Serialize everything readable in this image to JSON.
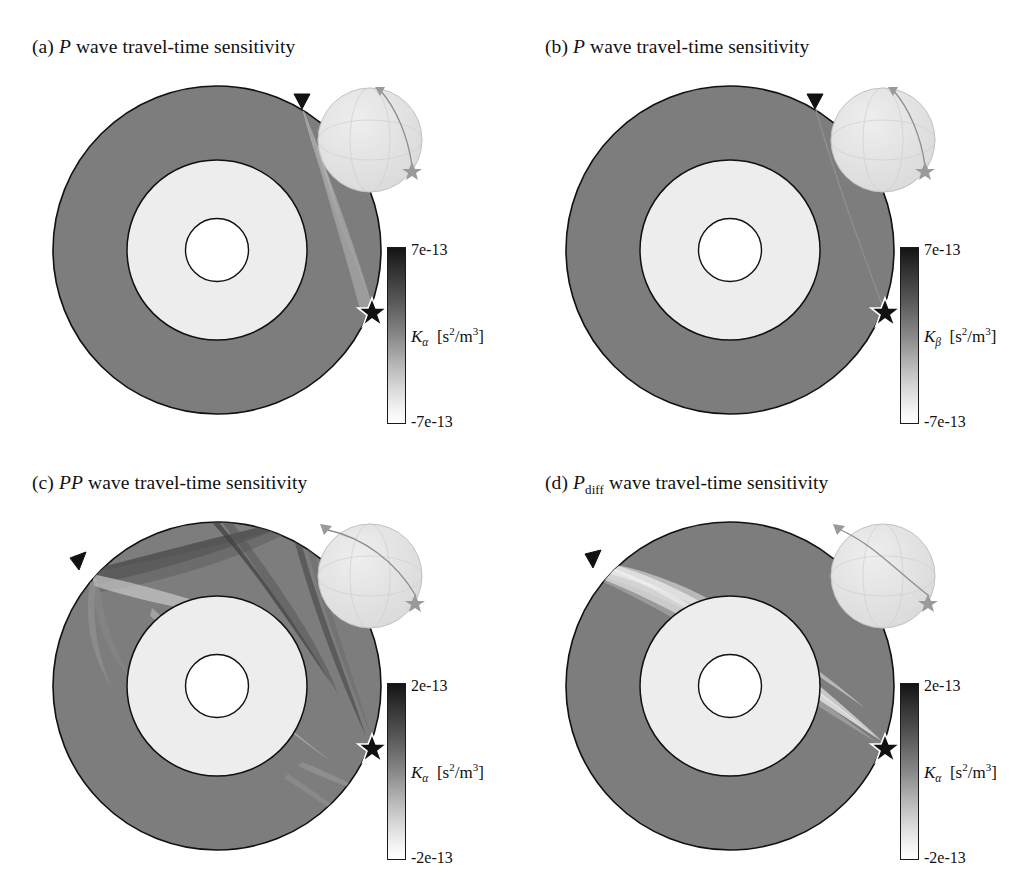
{
  "figure": {
    "type": "scientific-figure",
    "layout": {
      "rows": 2,
      "cols": 2,
      "width": 1026,
      "height": 872
    },
    "earth_model": {
      "layers": [
        {
          "name": "mantle",
          "color": "#7d7d7d",
          "outer_radius_frac": 1.0
        },
        {
          "name": "outer-core",
          "color": "#ededed",
          "outer_radius_frac": 0.547
        },
        {
          "name": "inner-core",
          "color": "#ffffff",
          "outer_radius_frac": 0.191
        }
      ],
      "markers": [
        {
          "name": "receiver-station",
          "glyph": "triangle",
          "position": "top",
          "angle_deg": 74
        },
        {
          "name": "source-earthquake",
          "glyph": "star",
          "position": "right",
          "angle_deg": 2
        }
      ]
    }
  },
  "panels": [
    {
      "id": "a",
      "label": "(a)",
      "phase": "P",
      "phase_sub": "",
      "title_rest": "wave travel-time sensitivity",
      "kernel_parameter": "K",
      "kernel_sub": "α",
      "units": "[s²/m³]",
      "colorbar": {
        "max": "7e-13",
        "min": "-7e-13",
        "max_value": 7e-13,
        "min_value": -7e-13
      },
      "kernel_shape": "single banana-doughnut crescent from station to source through mid mantle"
    },
    {
      "id": "b",
      "label": "(b)",
      "phase": "P",
      "phase_sub": "",
      "title_rest": "wave travel-time sensitivity",
      "kernel_parameter": "K",
      "kernel_sub": "β",
      "units": "[s²/m³]",
      "colorbar": {
        "max": "7e-13",
        "min": "-7e-13",
        "max_value": 7e-13,
        "min_value": -7e-13
      },
      "kernel_shape": "near-zero shear sensitivity, faint thin ray line only"
    },
    {
      "id": "c",
      "label": "(c)",
      "phase": "PP",
      "phase_sub": "",
      "title_rest": "wave travel-time sensitivity",
      "kernel_parameter": "K",
      "kernel_sub": "α",
      "units": "[s²/m³]",
      "colorbar": {
        "max": "2e-13",
        "min": "-2e-13",
        "max_value": 2e-13,
        "min_value": -2e-13
      },
      "kernel_shape": "complex multi-branch surface-reflected kernel with bounce point near surface"
    },
    {
      "id": "d",
      "label": "(d)",
      "phase": "P",
      "phase_sub": "diff",
      "title_rest": "wave travel-time sensitivity",
      "kernel_parameter": "K",
      "kernel_sub": "α",
      "units": "[s²/m³]",
      "colorbar": {
        "max": "2e-13",
        "min": "-2e-13",
        "max_value": 2e-13,
        "min_value": -2e-13
      },
      "kernel_shape": "diffracted wave kernel hugging the core-mantle boundary"
    }
  ],
  "inset": {
    "name": "globe-inset",
    "sphere_color": "#e3e3e3",
    "description": "small shaded globe with graticule and great-circle path between source and receiver"
  }
}
